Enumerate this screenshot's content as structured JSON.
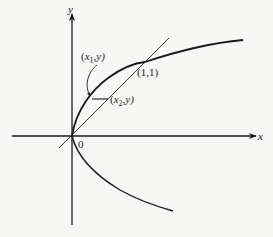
{
  "diagram": {
    "axes": {
      "x_label": "x",
      "y_label": "y",
      "origin_label": "0"
    },
    "curves": [
      {
        "name": "upper-branch",
        "equation_hint": "y = sqrt(x)"
      },
      {
        "name": "lower-branch",
        "equation_hint": "y = -sqrt(x)"
      },
      {
        "name": "line",
        "equation_hint": "y = x"
      }
    ],
    "points": {
      "intersection": "(1,1)",
      "p1": {
        "open": "(",
        "var": "x",
        "sub": "1",
        "rest": ",y)"
      },
      "p2": {
        "open": "(",
        "var": "x",
        "sub": "2",
        "rest": ",y)"
      }
    },
    "colors": {
      "ink": "#1a1a1a",
      "background": "#f7f7f5"
    }
  }
}
